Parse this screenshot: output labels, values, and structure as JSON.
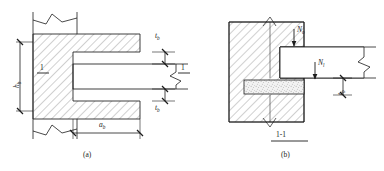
{
  "figure": {
    "type": "engineering-detail-drawing",
    "ink_color": "#1c1c1c",
    "hatch_color": "#8a8a8a",
    "grout_color": "#9a9a9a"
  },
  "panel_a": {
    "caption": "(a)",
    "section_mark_left": "1",
    "section_mark_right": "1",
    "dim_height": {
      "symbol": "h",
      "sub": "b"
    },
    "dim_width": {
      "symbol": "a",
      "sub": "b"
    },
    "dim_gap_top": {
      "symbol": "t",
      "sub": "b"
    },
    "dim_gap_bottom": {
      "symbol": "t",
      "sub": "b"
    }
  },
  "panel_b": {
    "caption": "(b)",
    "section_title": "1-1",
    "force_upper": {
      "symbol": "N",
      "sub": "o"
    },
    "force_lower": {
      "symbol": "N",
      "sub": "l"
    },
    "dim_bearing": {
      "symbol": "t",
      "sub": "b"
    }
  }
}
